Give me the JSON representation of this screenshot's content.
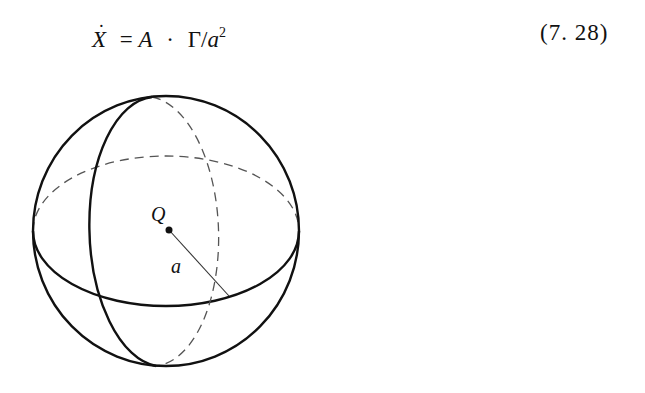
{
  "equation": {
    "lhs_symbol": "X",
    "lhs_accent": "˙",
    "equals": "=",
    "term_a": "A",
    "operator": "·",
    "term_gamma": "Γ",
    "slash": "/",
    "term_denominator": "a",
    "exponent": "2",
    "number": "(7. 28)"
  },
  "figure": {
    "type": "sphere-diagram",
    "center_label": "Q",
    "radius_label": "a",
    "line_color": "#111111",
    "dashed_color": "#555555"
  }
}
